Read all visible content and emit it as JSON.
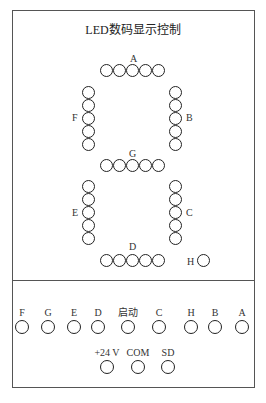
{
  "title": "LED数码显示控制",
  "segments": {
    "A": {
      "label": "A",
      "count": 5
    },
    "B": {
      "label": "B",
      "count": 5
    },
    "C": {
      "label": "C",
      "count": 5
    },
    "D": {
      "label": "D",
      "count": 5
    },
    "E": {
      "label": "E",
      "count": 5
    },
    "F": {
      "label": "F",
      "count": 5
    },
    "G": {
      "label": "G",
      "count": 5
    },
    "H": {
      "label": "H",
      "count": 1
    }
  },
  "terminals_row1": [
    {
      "label": "F"
    },
    {
      "label": "G"
    },
    {
      "label": "E"
    },
    {
      "label": "D"
    },
    {
      "label": "启动"
    },
    {
      "label": "C"
    },
    {
      "label": "H"
    },
    {
      "label": "B"
    },
    {
      "label": "A"
    }
  ],
  "terminals_row2": [
    {
      "label": "+24 V"
    },
    {
      "label": "COM"
    },
    {
      "label": "SD"
    }
  ]
}
